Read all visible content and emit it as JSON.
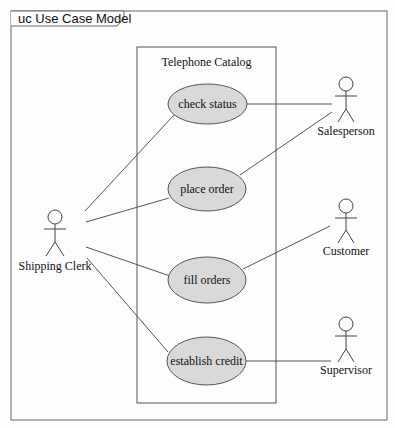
{
  "frame": {
    "label": "uc Use Case Model"
  },
  "system": {
    "name": "Telephone Catalog"
  },
  "use_cases": [
    {
      "id": "check-status",
      "label": "check status"
    },
    {
      "id": "place-order",
      "label": "place order"
    },
    {
      "id": "fill-orders",
      "label": "fill orders"
    },
    {
      "id": "establish-credit",
      "label": "establish credit"
    }
  ],
  "actors": [
    {
      "id": "shipping-clerk",
      "label": "Shipping Clerk"
    },
    {
      "id": "salesperson",
      "label": "Salesperson"
    },
    {
      "id": "customer",
      "label": "Customer"
    },
    {
      "id": "supervisor",
      "label": "Supervisor"
    }
  ],
  "associations": [
    {
      "from": "Shipping Clerk",
      "to": "check status"
    },
    {
      "from": "Shipping Clerk",
      "to": "place order"
    },
    {
      "from": "Shipping Clerk",
      "to": "fill orders"
    },
    {
      "from": "Shipping Clerk",
      "to": "establish credit"
    },
    {
      "from": "Salesperson",
      "to": "check status"
    },
    {
      "from": "Salesperson",
      "to": "place order"
    },
    {
      "from": "Customer",
      "to": "fill orders"
    },
    {
      "from": "Supervisor",
      "to": "establish credit"
    }
  ],
  "colors": {
    "use_case_fill": "#d9d9d9",
    "stroke": "#555555",
    "background": "#fdfdfd"
  }
}
